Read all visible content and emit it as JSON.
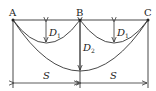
{
  "diagram": {
    "points": {
      "A": {
        "label": "A",
        "x": 13,
        "y": 20
      },
      "B": {
        "label": "B",
        "x": 80,
        "y": 20
      },
      "C": {
        "label": "C",
        "x": 148,
        "y": 20
      }
    },
    "labels": {
      "d1_left": "D",
      "d1_left_sub": "1",
      "d1_right": "D",
      "d1_right_sub": "1",
      "d2": "D",
      "d2_sub": "2",
      "s_left": "S",
      "s_right": "S"
    },
    "colors": {
      "line": "#333333",
      "background": "#ffffff"
    }
  }
}
